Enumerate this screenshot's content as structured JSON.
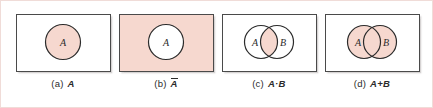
{
  "figure": {
    "name": "venn-diagram-boolean-operations",
    "border_color": "#f0dcd8",
    "background": "#ffffff"
  },
  "style": {
    "shade_color": "#f6d8cf",
    "stroke_color": "#2b2b2b",
    "box_stroke_color": "#4a4a4a",
    "unshaded_color": "#ffffff"
  },
  "panels": [
    {
      "id": "a",
      "tag": "(a)",
      "expression": "A",
      "overline": false,
      "operation": "identity",
      "rect_shaded": false,
      "circles": [
        {
          "label": "A",
          "shaded": true
        }
      ],
      "intersection_shaded": true
    },
    {
      "id": "b",
      "tag": "(b)",
      "expression": "A",
      "overline": true,
      "operation": "complement",
      "rect_shaded": true,
      "circles": [
        {
          "label": "A",
          "shaded": false
        }
      ],
      "intersection_shaded": false
    },
    {
      "id": "c",
      "tag": "(c)",
      "expression": "A·B",
      "overline": false,
      "operation": "and",
      "rect_shaded": false,
      "circles": [
        {
          "label": "A",
          "shaded": false
        },
        {
          "label": "B",
          "shaded": false
        }
      ],
      "intersection_shaded": true
    },
    {
      "id": "d",
      "tag": "(d)",
      "expression": "A+B",
      "overline": false,
      "operation": "or",
      "rect_shaded": false,
      "circles": [
        {
          "label": "A",
          "shaded": true
        },
        {
          "label": "B",
          "shaded": true
        }
      ],
      "intersection_shaded": true
    }
  ]
}
